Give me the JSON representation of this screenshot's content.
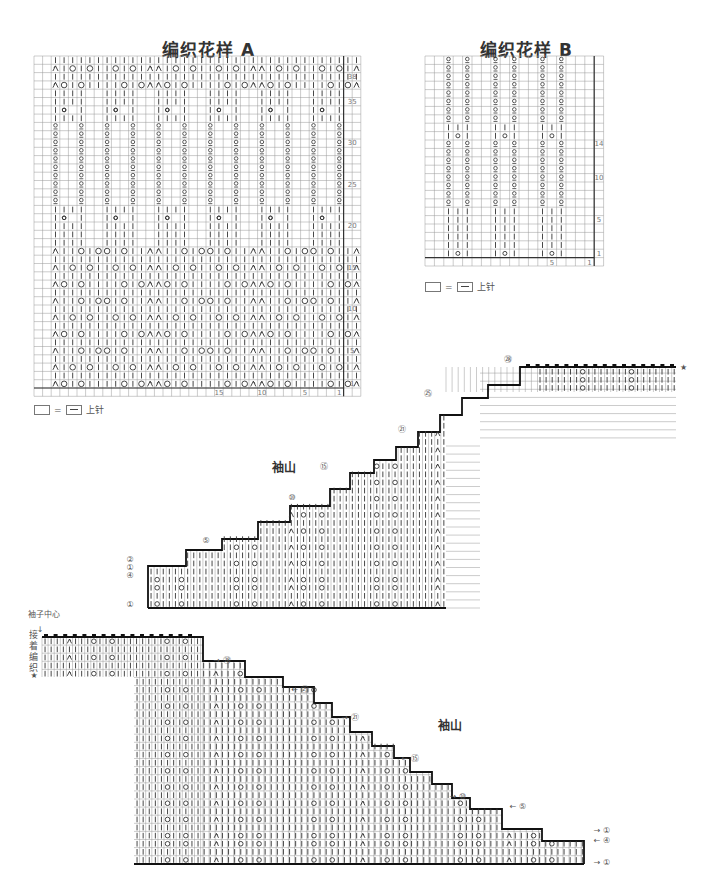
{
  "chart_a": {
    "title": "编织花样 A",
    "cols": 36,
    "rows": 40,
    "row_numbers": [
      "38",
      "35",
      "30",
      "25",
      "20",
      "15",
      "10",
      "5",
      "1"
    ],
    "col_numbers": [
      "15",
      "10",
      "5",
      "1"
    ],
    "legend": {
      "eq": "=",
      "label": "上针"
    }
  },
  "chart_b": {
    "title": "编织花样 B",
    "cols": 18,
    "rows": 24,
    "row_numbers": [
      "14",
      "10",
      "5",
      "1"
    ],
    "col_numbers": [
      "5",
      "1"
    ],
    "legend": {
      "eq": "=",
      "label": "上针"
    }
  },
  "sleeve_top": {
    "label": "袖山",
    "markers": [
      "㉘",
      "㉕",
      "㉑",
      "⑮",
      "⑩",
      "⑤",
      "②",
      "①",
      "④",
      "①"
    ],
    "star": "★"
  },
  "sleeve_bottom": {
    "label": "袖山",
    "center_label": "袖子中心",
    "join_label": "接着编织",
    "star": "★",
    "markers": [
      "㉘",
      "㉕",
      "㉑",
      "⑮",
      "⑩",
      "⑤",
      "①",
      "④",
      "①"
    ]
  },
  "symbols": {
    "knit": "|",
    "yarn_over": "○",
    "k2tog_right": "⋌",
    "k2tog_left": "⋋",
    "twisted": "ℓ",
    "bind_off": "▬"
  }
}
